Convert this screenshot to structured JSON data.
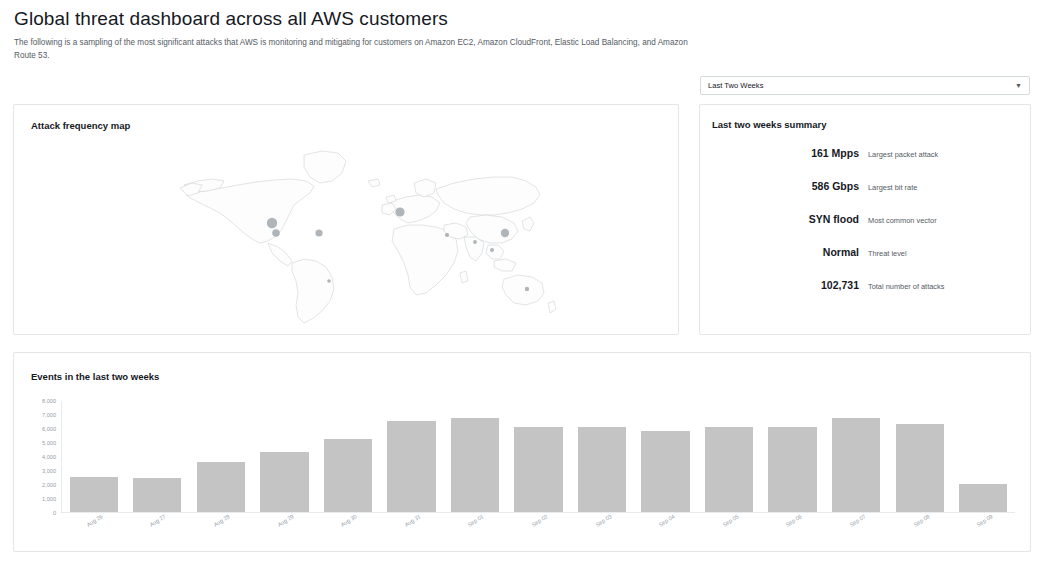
{
  "header": {
    "title": "Global threat dashboard across all AWS customers",
    "subtitle": "The following is a sampling of the most significant attacks that AWS is monitoring and mitigating for customers on Amazon EC2, Amazon CloudFront, Elastic Load Balancing, and Amazon Route 53."
  },
  "period_selector": {
    "value": "Last Two Weeks",
    "caret": "▼",
    "options": [
      "Last Two Weeks"
    ]
  },
  "map_panel": {
    "title": "Attack frequency map",
    "markers": [
      {
        "name": "us-west",
        "cx": 108,
        "cy": 90,
        "r": 5.2
      },
      {
        "name": "us-west-south",
        "cx": 112,
        "cy": 100,
        "r": 3.8
      },
      {
        "name": "us-east",
        "cx": 155,
        "cy": 100,
        "r": 3.6
      },
      {
        "name": "ireland",
        "cx": 236,
        "cy": 79,
        "r": 4.6
      },
      {
        "name": "mediterranean",
        "cx": 283,
        "cy": 102,
        "r": 2.1
      },
      {
        "name": "india",
        "cx": 311,
        "cy": 109,
        "r": 1.9
      },
      {
        "name": "east-asia",
        "cx": 341,
        "cy": 100,
        "r": 4.2
      },
      {
        "name": "southeast-asia",
        "cx": 328,
        "cy": 117,
        "r": 2.0
      },
      {
        "name": "australia",
        "cx": 363,
        "cy": 156,
        "r": 2.2
      },
      {
        "name": "south-america",
        "cx": 165,
        "cy": 148,
        "r": 1.8
      }
    ]
  },
  "summary_panel": {
    "title": "Last two weeks summary",
    "rows": [
      {
        "value": "161 Mpps",
        "label": "Largest packet attack"
      },
      {
        "value": "586 Gbps",
        "label": "Largest bit rate"
      },
      {
        "value": "SYN flood",
        "label": "Most common vector"
      },
      {
        "value": "Normal",
        "label": "Threat level"
      },
      {
        "value": "102,731",
        "label": "Total number of attacks"
      }
    ]
  },
  "events_panel": {
    "title": "Events in the last two weeks"
  },
  "colors": {
    "bar": "#c4c4c4",
    "axis": "#e8eaec",
    "tick_text": "#95a0a8",
    "panel_border": "#e4e6e7",
    "text_primary": "#16191f",
    "text_secondary": "#545b64"
  },
  "chart_data": {
    "type": "bar",
    "title": "Events in the last two weeks",
    "xlabel": "",
    "ylabel": "",
    "ylim": [
      0,
      8000
    ],
    "grid": false,
    "legend": null,
    "ytick_labels": [
      "8,000",
      "7,000",
      "6,000",
      "5,000",
      "4,000",
      "3,000",
      "2,000",
      "1,000",
      "0"
    ],
    "ytick_values": [
      8000,
      7000,
      6000,
      5000,
      4000,
      3000,
      2000,
      1000,
      0
    ],
    "categories": [
      "Aug 26",
      "Aug 27",
      "Aug 28",
      "Aug 29",
      "Aug 30",
      "Aug 31",
      "Sep 01",
      "Sep 02",
      "Sep 03",
      "Sep 04",
      "Sep 05",
      "Sep 06",
      "Sep 07",
      "Sep 08",
      "Sep 09"
    ],
    "values": [
      2500,
      2400,
      3600,
      4300,
      5200,
      6500,
      6700,
      6100,
      6100,
      5800,
      6100,
      6100,
      6700,
      6300,
      2000
    ]
  }
}
